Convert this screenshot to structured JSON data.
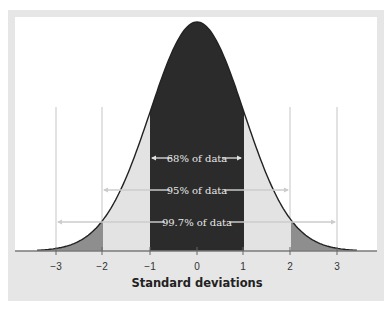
{
  "chart_data": {
    "type": "area",
    "title": "",
    "xlabel": "Standard deviations",
    "ylabel": "",
    "distribution": "normal",
    "mean": 0,
    "sd": 1,
    "xlim": [
      -3.4,
      3.4
    ],
    "grid": false,
    "tick_labels": [
      "-3",
      "-2",
      "-1",
      "0",
      "1",
      "2",
      "3"
    ],
    "ticks": [
      -3,
      -2,
      -1,
      0,
      1,
      2,
      3
    ],
    "regions": [
      {
        "name": "within 1 SD",
        "from": -1,
        "to": 1,
        "color": "#2b2b2b"
      },
      {
        "name": "1 to 2 SD",
        "from": -2,
        "to": -1,
        "color": "#e3e3e3"
      },
      {
        "name": "1 to 2 SD",
        "from": 1,
        "to": 2,
        "color": "#e3e3e3"
      },
      {
        "name": "2 to 3 SD",
        "from": -3.4,
        "to": -2,
        "color": "#8e8e8e"
      },
      {
        "name": "2 to 3 SD",
        "from": 2,
        "to": 3.4,
        "color": "#8e8e8e"
      }
    ],
    "annotations": [
      {
        "label": "68% of data",
        "from": -1,
        "to": 1,
        "percent": 68
      },
      {
        "label": "95% of data",
        "from": -2,
        "to": 2,
        "percent": 95
      },
      {
        "label": "99.7% of data",
        "from": -3,
        "to": 3,
        "percent": 99.7
      }
    ],
    "reference_lines": [
      -3,
      -2,
      2,
      3
    ]
  },
  "labels": {
    "xlabel": "Standard deviations",
    "band68": "68% of data",
    "band95": "95% of data",
    "band997": "99.7% of data",
    "t_m3": "−3",
    "t_m2": "−2",
    "t_m1": "−1",
    "t_0": "0",
    "t_1": "1",
    "t_2": "2",
    "t_3": "3"
  }
}
